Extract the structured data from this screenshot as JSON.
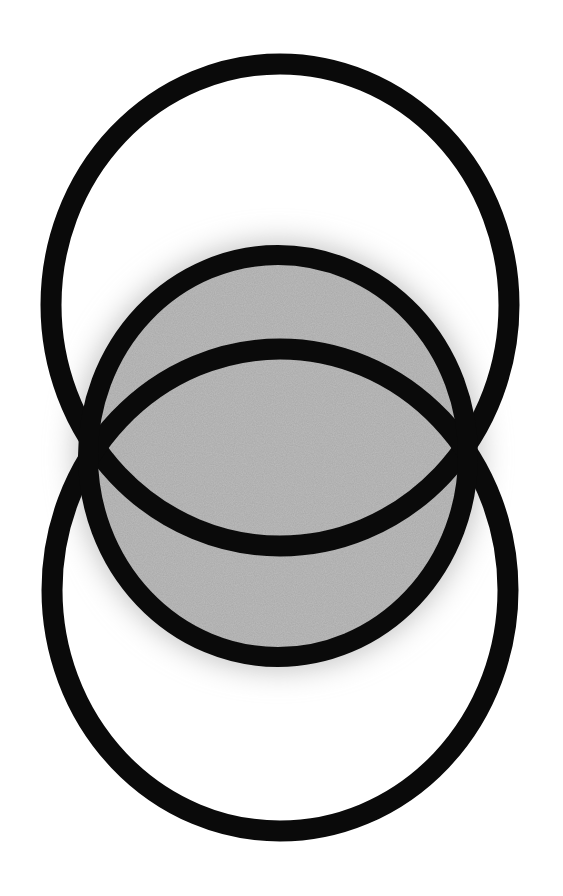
{
  "diagram": {
    "title": "",
    "description": "Three overlapping rings: upper and lower large rings intersecting to form a central vesica (eye shape), with a smaller middle ring filled gray and surrounded by a soft glow",
    "background_color": "#ffffff",
    "stroke_color": "#0a0a0a",
    "fill_color": "#a9a9a9",
    "glow_color": "#c8c8c8",
    "stroke_width": 21,
    "shapes": [
      {
        "id": "upper-ring",
        "type": "ellipse",
        "cx": 280,
        "cy": 305,
        "rx": 229,
        "ry": 241,
        "fill": "none"
      },
      {
        "id": "lower-ring",
        "type": "ellipse",
        "cx": 280,
        "cy": 590,
        "rx": 228,
        "ry": 241,
        "fill": "none"
      },
      {
        "id": "middle-ring",
        "type": "ellipse",
        "cx": 278,
        "cy": 456,
        "rx": 190,
        "ry": 201,
        "fill": "gray"
      }
    ],
    "intersections": [
      {
        "id": "left-crossing",
        "x": 85,
        "y": 443
      },
      {
        "id": "right-crossing",
        "x": 467,
        "y": 443
      }
    ]
  }
}
